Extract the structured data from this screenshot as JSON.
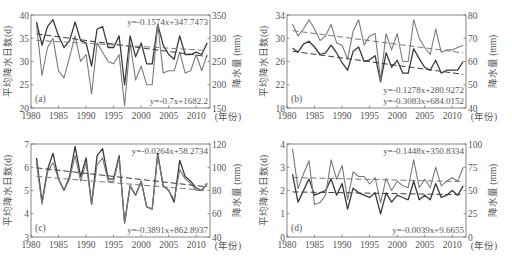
{
  "figure": {
    "x_unit_label": "(年份)",
    "left_axis_label": "平均降水日数(d)",
    "right_axis_label": "降水量 (mm)"
  },
  "colors": {
    "days_line": "#3a3a3a",
    "precip_line": "#7a7a7a",
    "axis": "#666666",
    "text": "#555555"
  },
  "chart_data": [
    {
      "type": "line",
      "panel_label": "(a)",
      "title": "",
      "xlabel": "(年份)",
      "ylabel": "平均降水日数(d)",
      "y2label": "降水量 (mm)",
      "xlim": [
        1980,
        2012.5
      ],
      "ylim": [
        20,
        40
      ],
      "y2lim": [
        150,
        350
      ],
      "xticks": [
        1980,
        1985,
        1990,
        1995,
        2000,
        2005,
        2010
      ],
      "yticks": [
        20,
        25,
        30,
        35,
        40
      ],
      "y2ticks": [
        150,
        200,
        250,
        300,
        350
      ],
      "grid": false,
      "x": [
        1981,
        1982,
        1983,
        1984,
        1985,
        1986,
        1987,
        1988,
        1989,
        1990,
        1991,
        1992,
        1993,
        1994,
        1995,
        1996,
        1997,
        1998,
        1999,
        2000,
        2001,
        2002,
        2003,
        2004,
        2005,
        2006,
        2007,
        2008,
        2009,
        2010,
        2011,
        2012
      ],
      "series": [
        {
          "name": "平均降水日数",
          "axis": "left",
          "style": "dark",
          "values": [
            38.5,
            33.5,
            37.5,
            39.0,
            35.5,
            33.0,
            34.5,
            38.5,
            34.5,
            34.0,
            29.0,
            37.0,
            37.5,
            33.0,
            33.0,
            35.5,
            25.0,
            35.5,
            31.0,
            34.0,
            29.5,
            29.5,
            38.0,
            33.5,
            31.5,
            30.5,
            35.5,
            31.5,
            31.5,
            32.0,
            31.5,
            34.0
          ]
        },
        {
          "name": "降水量",
          "axis": "right",
          "style": "light",
          "values": [
            330,
            220,
            280,
            300,
            230,
            215,
            260,
            305,
            250,
            265,
            180,
            290,
            270,
            250,
            245,
            265,
            155,
            290,
            210,
            240,
            200,
            200,
            330,
            225,
            230,
            230,
            270,
            225,
            230,
            265,
            230,
            265
          ]
        }
      ],
      "trendlines": [
        {
          "axis": "left",
          "equation": "y=-0.1574x+347.7473",
          "slope": -0.1574,
          "intercept": 347.7473,
          "label_pos": "top-right"
        },
        {
          "axis": "right",
          "equation": "y=-0.7x+1682.2",
          "slope": -0.7,
          "intercept": 1682.2,
          "label_pos": "bottom-right"
        }
      ]
    },
    {
      "type": "line",
      "panel_label": "(b)",
      "title": "",
      "xlabel": "(年份)",
      "ylabel": "平均降水日数(d)",
      "y2label": "降水量 (mm)",
      "xlim": [
        1980,
        2012.5
      ],
      "ylim": [
        18,
        34
      ],
      "y2lim": [
        40,
        80
      ],
      "xticks": [
        1980,
        1985,
        1990,
        1995,
        2000,
        2005,
        2010
      ],
      "yticks": [
        18,
        22,
        26,
        30,
        34
      ],
      "y2ticks": [
        40,
        50,
        60,
        70,
        80
      ],
      "grid": false,
      "x": [
        1981,
        1982,
        1983,
        1984,
        1985,
        1986,
        1987,
        1988,
        1989,
        1990,
        1991,
        1992,
        1993,
        1994,
        1995,
        1996,
        1997,
        1998,
        1999,
        2000,
        2001,
        2002,
        2003,
        2004,
        2005,
        2006,
        2007,
        2008,
        2009,
        2010,
        2011,
        2012
      ],
      "series": [
        {
          "name": "平均降水日数",
          "axis": "left",
          "style": "dark",
          "values": [
            28.3,
            27.6,
            29.0,
            29.5,
            28.5,
            27.2,
            27.5,
            28.8,
            27.5,
            25.8,
            24.5,
            27.7,
            28.5,
            26.0,
            26.3,
            27.0,
            22.5,
            27.5,
            25.0,
            26.2,
            24.0,
            24.0,
            28.2,
            26.5,
            25.0,
            24.5,
            26.2,
            24.0,
            24.5,
            24.5,
            24.5,
            26.0
          ]
        },
        {
          "name": "降水量",
          "axis": "right",
          "style": "light",
          "values": [
            76,
            71,
            74,
            78,
            74,
            69,
            71,
            76,
            68,
            67,
            61,
            73,
            78,
            67,
            71,
            72,
            52,
            72,
            65,
            72,
            60,
            60,
            78,
            70,
            66,
            63,
            74,
            64,
            65,
            65,
            66,
            67
          ]
        }
      ],
      "trendlines": [
        {
          "axis": "left",
          "equation": "y=-0.1278x+280.9272",
          "slope": -0.1278,
          "intercept": 280.9272,
          "label_pos": "bottom-right"
        },
        {
          "axis": "right",
          "equation": "y=-0.3083x+684.0152",
          "slope": -0.3083,
          "intercept": 684.0152,
          "label_pos": "bottom-right"
        }
      ]
    },
    {
      "type": "line",
      "panel_label": "(c)",
      "title": "",
      "xlabel": "(年份)",
      "ylabel": "平均降水日数(d)",
      "y2label": "降水量 (mm)",
      "xlim": [
        1980,
        2012.5
      ],
      "ylim": [
        3,
        7
      ],
      "y2lim": [
        40,
        120
      ],
      "xticks": [
        1980,
        1985,
        1990,
        1995,
        2000,
        2005,
        2010
      ],
      "yticks": [
        3,
        4,
        5,
        6,
        7
      ],
      "y2ticks": [
        40,
        60,
        80,
        100,
        120
      ],
      "grid": false,
      "x": [
        1981,
        1982,
        1983,
        1984,
        1985,
        1986,
        1987,
        1988,
        1989,
        1990,
        1991,
        1992,
        1993,
        1994,
        1995,
        1996,
        1997,
        1998,
        1999,
        2000,
        2001,
        2002,
        2003,
        2004,
        2005,
        2006,
        2007,
        2008,
        2009,
        2010,
        2011,
        2012
      ],
      "series": [
        {
          "name": "平均降水日数",
          "axis": "left",
          "style": "dark",
          "values": [
            6.4,
            4.5,
            5.9,
            6.6,
            5.5,
            5.0,
            5.6,
            6.9,
            5.6,
            6.4,
            4.4,
            6.5,
            6.8,
            5.5,
            5.5,
            6.5,
            3.6,
            5.2,
            4.8,
            5.4,
            4.3,
            4.2,
            6.6,
            5.2,
            5.0,
            4.5,
            6.3,
            5.6,
            5.4,
            5.1,
            5.0,
            5.3
          ]
        },
        {
          "name": "降水量",
          "axis": "right",
          "style": "light",
          "values": [
            104,
            68,
            96,
            104,
            90,
            80,
            90,
            110,
            88,
            104,
            68,
            102,
            108,
            88,
            88,
            108,
            52,
            84,
            76,
            88,
            66,
            64,
            110,
            84,
            80,
            72,
            98,
            90,
            86,
            80,
            80,
            86
          ]
        }
      ],
      "trendlines": [
        {
          "axis": "left",
          "equation": "y=-0.0264x+58.2734",
          "slope": -0.0264,
          "intercept": 58.2734,
          "label_pos": "top-right"
        },
        {
          "axis": "right",
          "equation": "y=-0.3891x+862.8937",
          "slope": -0.3891,
          "intercept": 862.8937,
          "label_pos": "bottom-right"
        }
      ]
    },
    {
      "type": "line",
      "panel_label": "(d)",
      "title": "",
      "xlabel": "(年份)",
      "ylabel": "平均降水日数(d)",
      "y2label": "降水量 (mm)",
      "xlim": [
        1980,
        2012.5
      ],
      "ylim": [
        0,
        4
      ],
      "y2lim": [
        0,
        100
      ],
      "xticks": [
        1980,
        1985,
        1990,
        1995,
        2000,
        2005,
        2010
      ],
      "yticks": [
        0,
        1,
        2,
        3,
        4
      ],
      "y2ticks": [
        0,
        25,
        50,
        75,
        100
      ],
      "grid": false,
      "x": [
        1981,
        1982,
        1983,
        1984,
        1985,
        1986,
        1987,
        1988,
        1989,
        1990,
        1991,
        1992,
        1993,
        1994,
        1995,
        1996,
        1997,
        1998,
        1999,
        2000,
        2001,
        2002,
        2003,
        2004,
        2005,
        2006,
        2007,
        2008,
        2009,
        2010,
        2011,
        2012
      ],
      "series": [
        {
          "name": "平均降水日数",
          "axis": "left",
          "style": "dark",
          "values": [
            2.7,
            1.5,
            2.0,
            2.5,
            1.8,
            1.9,
            2.0,
            2.5,
            1.8,
            2.3,
            1.2,
            2.1,
            1.9,
            1.8,
            1.7,
            1.9,
            1.0,
            1.9,
            1.5,
            1.8,
            1.7,
            1.6,
            2.4,
            1.6,
            1.8,
            1.6,
            2.3,
            1.7,
            1.8,
            2.0,
            1.8,
            2.2
          ]
        },
        {
          "name": "降水量",
          "axis": "right",
          "style": "light",
          "values": [
            95,
            52,
            68,
            82,
            35,
            37,
            45,
            83,
            62,
            77,
            40,
            70,
            65,
            65,
            57,
            64,
            37,
            63,
            50,
            60,
            55,
            53,
            83,
            53,
            62,
            53,
            75,
            55,
            60,
            64,
            60,
            75
          ]
        }
      ],
      "trendlines": [
        {
          "axis": "right",
          "equation": "y=-0.1448x+350.8334",
          "slope": -0.1448,
          "intercept": 350.8334,
          "label_pos": "top-right"
        },
        {
          "axis": "left",
          "equation": "y=-0.0039x+9.6655",
          "slope": -0.0039,
          "intercept": 9.6655,
          "label_pos": "bottom-right"
        }
      ]
    }
  ]
}
